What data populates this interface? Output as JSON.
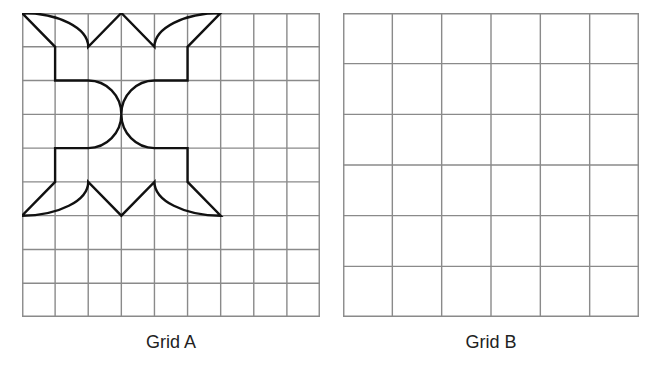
{
  "diagram": {
    "grids": [
      {
        "id": "A",
        "label": "Grid A",
        "columns": 9,
        "rows": 9,
        "cell_size_px": 33.5,
        "shape": {
          "description": "Symmetric figure composed of straight segments and quarter-circle arcs, spanning columns 0-6 and rows 0-6",
          "path_cells": "M0,0 L1,1 L1,2 L2,2 A1,1 0 0 1 3,3 A1,1 0 0 1 2,4 L1,4 L1,5 L0,6 A2,1 0 0 0 2,5 L3,6 L4,5 A2,1 0 0 0 6,6 L5,5 L5,4 L4,4 A1,1 0 0 1 3,3 A1,1 0 0 1 4,2 L5,2 L5,1 L6,0 A2,1 0 0 0 4,1 L3,0 L2,1 A2,1 0 0 0 0,0 Z"
        }
      },
      {
        "id": "B",
        "label": "Grid B",
        "columns": 6,
        "rows": 6,
        "cell_size_px": 49.5,
        "shape": null
      }
    ],
    "colors": {
      "grid_line": "#8a8a8a",
      "shape_stroke": "#111111",
      "label_text": "#222222"
    }
  }
}
